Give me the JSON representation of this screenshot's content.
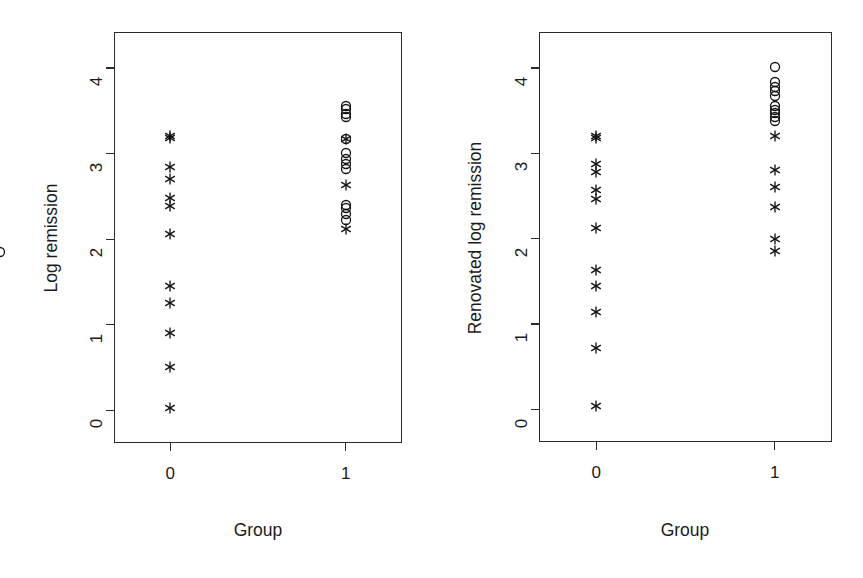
{
  "figure": {
    "background_color": "#ffffff",
    "ink_color": "#141414",
    "width": 863,
    "height": 578
  },
  "panels": [
    {
      "id": "left",
      "ylabel": "Log remission",
      "xlabel": "Group",
      "ytick_labels": [
        "0",
        "1",
        "2",
        "3",
        "4"
      ],
      "xtick_labels": [
        "0",
        "1"
      ]
    },
    {
      "id": "right",
      "ylabel": "Renovated log remission",
      "xlabel": "Group",
      "ytick_labels": [
        "0",
        "1",
        "2",
        "3",
        "4"
      ],
      "xtick_labels": [
        "0",
        "1"
      ]
    }
  ],
  "chart_data": [
    {
      "type": "scatter",
      "panel": "left",
      "title": "",
      "xlabel": "Group",
      "ylabel": "Log remission",
      "xlim": [
        -0.32,
        1.32
      ],
      "ylim": [
        -0.38,
        4.42
      ],
      "xticks": [
        0,
        1
      ],
      "xticklabels": [
        "0",
        "1"
      ],
      "yticks": [
        0,
        1,
        2,
        3,
        4
      ],
      "yticklabels": [
        "0",
        "1",
        "2",
        "3",
        "4"
      ],
      "grid": false,
      "legend": "none",
      "series": [
        {
          "name": "Group 0",
          "marker": "star",
          "x": [
            0,
            0,
            0,
            0,
            0,
            0,
            0,
            0,
            0,
            0,
            0,
            0
          ],
          "y": [
            3.2,
            3.18,
            2.84,
            2.7,
            2.48,
            2.39,
            2.06,
            1.45,
            1.25,
            0.9,
            0.51,
            0.03
          ]
        },
        {
          "name": "Group 1 (circles)",
          "marker": "circle",
          "x": [
            1,
            1,
            1,
            1,
            1,
            1,
            1,
            1,
            1,
            1,
            1,
            1,
            1
          ],
          "y": [
            3.55,
            3.52,
            3.46,
            3.43,
            3.17,
            3.01,
            2.94,
            2.88,
            2.82,
            2.4,
            2.36,
            2.29,
            2.22,
            1.85
          ]
        },
        {
          "name": "Group 1 (stars)",
          "marker": "star",
          "x": [
            1,
            1,
            1
          ],
          "y": [
            3.17,
            2.63,
            2.12
          ]
        }
      ]
    },
    {
      "type": "scatter",
      "panel": "right",
      "title": "",
      "xlabel": "Group",
      "ylabel": "Renovated log remission",
      "xlim": [
        -0.32,
        1.32
      ],
      "ylim": [
        -0.38,
        4.42
      ],
      "xticks": [
        0,
        1
      ],
      "xticklabels": [
        "0",
        "1"
      ],
      "yticks": [
        0,
        1,
        2,
        3,
        4
      ],
      "yticklabels": [
        "0",
        "1",
        "2",
        "3",
        "4"
      ],
      "grid": false,
      "legend": "none",
      "series": [
        {
          "name": "Group 0",
          "marker": "star",
          "x": [
            0,
            0,
            0,
            0,
            0,
            0,
            0,
            0,
            0,
            0,
            0,
            0
          ],
          "y": [
            3.2,
            3.18,
            2.88,
            2.78,
            2.57,
            2.46,
            2.13,
            1.63,
            1.45,
            1.14,
            0.72,
            0.04
          ]
        },
        {
          "name": "Group 1 (circles)",
          "marker": "circle",
          "x": [
            1,
            1,
            1,
            1,
            1,
            1,
            1,
            1,
            1,
            1
          ],
          "y": [
            4.01,
            3.83,
            3.78,
            3.73,
            3.67,
            3.55,
            3.51,
            3.47,
            3.42,
            3.38
          ]
        },
        {
          "name": "Group 1 (stars)",
          "marker": "star",
          "x": [
            1,
            1,
            1,
            1,
            1,
            1
          ],
          "y": [
            3.2,
            2.8,
            2.61,
            2.37,
            2.0,
            1.86
          ]
        }
      ]
    }
  ]
}
